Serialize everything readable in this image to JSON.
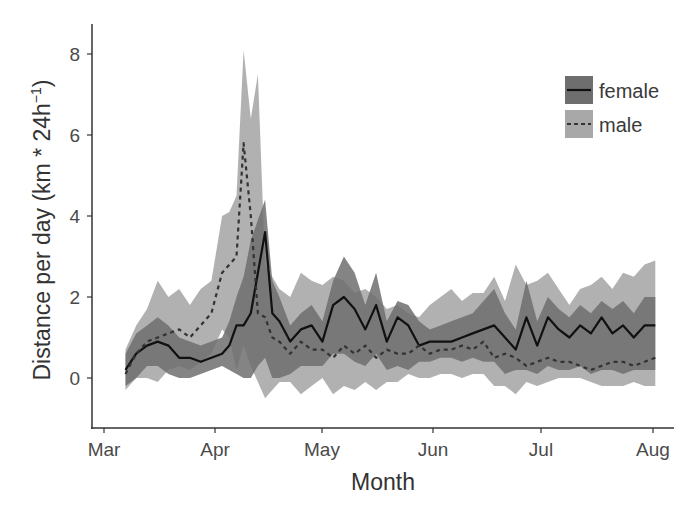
{
  "chart_data": {
    "type": "line",
    "title": "",
    "xlabel": "Month",
    "ylabel": "Distance per day (km * 24h⁻¹)",
    "ylabel_parts": {
      "main": "Distance per day (km * 24h",
      "sup": "−1",
      "close": ")"
    },
    "x_ticks": [
      "Mar",
      "Apr",
      "May",
      "Jun",
      "Jul",
      "Aug"
    ],
    "y_ticks": [
      0,
      2,
      4,
      6,
      8
    ],
    "ylim": [
      -1.2,
      8.9
    ],
    "xlim_days_from_mar1": [
      -2,
      159
    ],
    "grid": false,
    "legend_position": "top-right, inside",
    "x_unit": "day offset from Mar 1",
    "x": [
      6,
      9,
      12,
      15,
      18,
      21,
      24,
      27,
      30,
      33,
      35,
      37,
      39,
      41,
      43,
      45,
      47,
      49,
      52,
      55,
      58,
      61,
      64,
      67,
      70,
      73,
      76,
      79,
      82,
      85,
      88,
      91,
      94,
      97,
      100,
      103,
      106,
      109,
      112,
      115,
      118,
      121,
      124,
      127,
      130,
      133,
      136,
      139,
      142,
      145,
      148,
      151,
      154
    ],
    "series": [
      {
        "name": "female",
        "line_style": "solid",
        "line_color": "#111111",
        "band_color": "#6e6e6e",
        "values": [
          0.2,
          0.6,
          0.8,
          0.9,
          0.8,
          0.5,
          0.5,
          0.4,
          0.5,
          0.6,
          0.8,
          1.3,
          1.3,
          1.6,
          2.6,
          3.6,
          1.6,
          1.4,
          0.9,
          1.2,
          1.3,
          0.9,
          1.8,
          2.0,
          1.7,
          1.2,
          1.8,
          0.9,
          1.5,
          1.3,
          0.8,
          0.9,
          0.9,
          0.9,
          1.0,
          1.1,
          1.2,
          1.3,
          1.0,
          0.7,
          1.5,
          0.8,
          1.5,
          1.2,
          1.0,
          1.3,
          1.1,
          1.5,
          1.1,
          1.3,
          1.0,
          1.3,
          1.3
        ],
        "lower": [
          -0.2,
          0.0,
          0.3,
          0.3,
          0.1,
          0.0,
          0.0,
          0.1,
          0.2,
          0.3,
          0.2,
          0.1,
          0.0,
          0.0,
          0.3,
          0.5,
          0.0,
          0.0,
          0.1,
          0.3,
          0.3,
          0.3,
          0.6,
          0.6,
          0.4,
          0.3,
          0.6,
          0.2,
          0.3,
          0.2,
          0.4,
          0.4,
          0.5,
          0.5,
          0.4,
          0.5,
          0.4,
          0.4,
          0.1,
          0.2,
          0.2,
          0.1,
          0.3,
          0.2,
          0.2,
          0.3,
          0.1,
          0.2,
          0.2,
          0.1,
          0.2,
          0.2,
          0.2
        ],
        "upper": [
          0.6,
          1.1,
          1.3,
          1.5,
          1.3,
          1.0,
          0.9,
          0.8,
          0.9,
          1.0,
          1.4,
          2.0,
          2.5,
          3.4,
          3.9,
          4.4,
          2.4,
          2.0,
          1.3,
          1.6,
          1.8,
          1.4,
          2.4,
          3.0,
          2.6,
          1.8,
          2.6,
          1.4,
          1.9,
          1.8,
          1.4,
          1.2,
          1.3,
          1.4,
          1.5,
          1.6,
          1.9,
          2.2,
          1.6,
          1.2,
          2.4,
          1.4,
          2.0,
          1.7,
          1.5,
          1.8,
          1.6,
          1.9,
          1.7,
          1.9,
          1.6,
          2.0,
          2.0
        ]
      },
      {
        "name": "male",
        "line_style": "dashed",
        "line_color": "#333333",
        "band_color": "#a8a8a8",
        "values": [
          0.1,
          0.6,
          0.9,
          1.0,
          1.1,
          1.2,
          1.0,
          1.3,
          1.6,
          2.6,
          2.8,
          3.0,
          5.8,
          4.0,
          1.6,
          1.5,
          1.0,
          0.9,
          0.6,
          0.9,
          0.7,
          0.7,
          0.5,
          0.8,
          0.6,
          0.8,
          0.5,
          0.7,
          0.6,
          0.6,
          0.8,
          0.6,
          0.7,
          0.7,
          0.8,
          0.7,
          0.9,
          0.5,
          0.6,
          0.5,
          0.3,
          0.4,
          0.5,
          0.4,
          0.4,
          0.3,
          0.2,
          0.3,
          0.4,
          0.4,
          0.3,
          0.4,
          0.5
        ],
        "lower": [
          -0.3,
          0.0,
          0.0,
          -0.1,
          0.2,
          0.3,
          0.2,
          0.4,
          0.6,
          1.2,
          1.0,
          0.2,
          0.8,
          0.3,
          -0.1,
          -0.5,
          -0.3,
          -0.1,
          -0.1,
          -0.4,
          -0.2,
          0.0,
          -0.4,
          -0.2,
          -0.3,
          -0.1,
          -0.3,
          -0.1,
          -0.1,
          0.1,
          0.0,
          0.0,
          0.1,
          0.1,
          0.0,
          0.1,
          0.1,
          -0.2,
          -0.2,
          -0.4,
          -0.1,
          -0.2,
          -0.1,
          0.0,
          0.0,
          0.0,
          -0.1,
          -0.2,
          -0.2,
          -0.2,
          -0.1,
          -0.2,
          -0.2
        ],
        "upper": [
          0.7,
          1.3,
          1.7,
          2.4,
          2.0,
          2.2,
          1.8,
          2.2,
          2.4,
          4.0,
          4.1,
          4.5,
          8.1,
          6.4,
          7.5,
          2.8,
          2.5,
          2.2,
          2.0,
          2.6,
          2.4,
          2.3,
          2.5,
          2.4,
          2.1,
          2.2,
          2.0,
          1.7,
          1.8,
          1.6,
          1.5,
          1.8,
          2.0,
          2.2,
          1.9,
          2.1,
          2.1,
          2.5,
          1.9,
          2.8,
          2.3,
          2.4,
          2.6,
          2.2,
          1.8,
          2.2,
          2.3,
          2.5,
          2.2,
          2.6,
          2.5,
          2.8,
          2.9
        ]
      }
    ],
    "legend": [
      {
        "label": "female",
        "line_style": "solid",
        "swatch": "#6e6e6e"
      },
      {
        "label": "male",
        "line_style": "dashed",
        "swatch": "#a8a8a8"
      }
    ]
  }
}
